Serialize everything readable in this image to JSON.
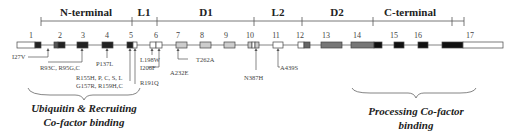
{
  "domains": [
    {
      "label": "N-terminal",
      "start": 41,
      "end": 132,
      "label_x": 86
    },
    {
      "label": "L1",
      "start": 132,
      "end": 157,
      "label_x": 144
    },
    {
      "label": "D1",
      "start": 157,
      "end": 254,
      "label_x": 206
    },
    {
      "label": "L2",
      "start": 254,
      "end": 302,
      "label_x": 278
    },
    {
      "label": "D2",
      "start": 302,
      "end": 373,
      "label_x": 337
    },
    {
      "label": "C-terminal",
      "start": 373,
      "end": 452,
      "label_x": 410
    },
    {
      "label": "",
      "start": 452,
      "end": 464,
      "label_x": 458
    }
  ],
  "exons": [
    {
      "num": "1",
      "x": 17,
      "w": 24,
      "segments": [
        {
          "w": 18,
          "fill": "#ffffff"
        },
        {
          "w": 6,
          "fill": "#222222"
        }
      ],
      "num_x": 31
    },
    {
      "num": "2",
      "x": 54,
      "w": 11,
      "segments": [
        {
          "w": 4,
          "fill": "#555555"
        },
        {
          "w": 7,
          "fill": "#222222"
        }
      ],
      "num_x": 60
    },
    {
      "num": "3",
      "x": 77,
      "w": 11,
      "segments": [
        {
          "w": 11,
          "fill": "#222222"
        }
      ],
      "num_x": 83
    },
    {
      "num": "4",
      "x": 102,
      "w": 11,
      "segments": [
        {
          "w": 11,
          "fill": "#222222"
        }
      ],
      "num_x": 107
    },
    {
      "num": "5",
      "x": 127,
      "w": 10,
      "segments": [
        {
          "w": 6,
          "fill": "#222222"
        },
        {
          "w": 4,
          "fill": "#ffffff"
        }
      ],
      "num_x": 131
    },
    {
      "num": "6",
      "x": 150,
      "w": 12,
      "segments": [
        {
          "w": 6,
          "fill": "#ffffff"
        },
        {
          "w": 6,
          "fill": "#ffffff"
        }
      ],
      "num_x": 156
    },
    {
      "num": "7",
      "x": 176,
      "w": 11,
      "segments": [
        {
          "w": 11,
          "fill": "#cccccc"
        }
      ],
      "num_x": 178
    },
    {
      "num": "8",
      "x": 200,
      "w": 11,
      "segments": [
        {
          "w": 11,
          "fill": "#cccccc"
        }
      ],
      "num_x": 202
    },
    {
      "num": "9",
      "x": 224,
      "w": 11,
      "segments": [
        {
          "w": 11,
          "fill": "#cccccc"
        }
      ],
      "num_x": 226
    },
    {
      "num": "10",
      "x": 248,
      "w": 11,
      "segments": [
        {
          "w": 4,
          "fill": "#cccccc"
        },
        {
          "w": 3,
          "fill": "#ffffff"
        },
        {
          "w": 4,
          "fill": "#cccccc"
        }
      ],
      "num_x": 250
    },
    {
      "num": "11",
      "x": 273,
      "w": 10,
      "segments": [
        {
          "w": 10,
          "fill": "#ffffff"
        }
      ],
      "num_x": 276
    },
    {
      "num": "12",
      "x": 298,
      "w": 12,
      "segments": [
        {
          "w": 6,
          "fill": "#ffffff"
        },
        {
          "w": 6,
          "fill": "#666666"
        }
      ],
      "num_x": 300
    },
    {
      "num": "13",
      "x": 321,
      "w": 21,
      "segments": [
        {
          "w": 21,
          "fill": "#777777"
        }
      ],
      "num_x": 326
    },
    {
      "num": "14",
      "x": 351,
      "w": 31,
      "segments": [
        {
          "w": 23,
          "fill": "#777777"
        },
        {
          "w": 8,
          "fill": "#111111"
        }
      ],
      "num_x": 357
    },
    {
      "num": "15",
      "x": 394,
      "w": 10,
      "segments": [
        {
          "w": 10,
          "fill": "#111111"
        }
      ],
      "num_x": 394
    },
    {
      "num": "16",
      "x": 418,
      "w": 10,
      "segments": [
        {
          "w": 10,
          "fill": "#111111"
        }
      ],
      "num_x": 418
    },
    {
      "num": "17",
      "x": 442,
      "w": 61,
      "segments": [
        {
          "w": 21,
          "fill": "#111111"
        },
        {
          "w": 40,
          "fill": "#ffffff"
        }
      ],
      "num_x": 470
    }
  ],
  "backbone": {
    "x1": 17,
    "x2": 503,
    "y": 45
  },
  "mutations": [
    {
      "label": "I27V"
    },
    {
      "label": "R93C, R95G,C"
    },
    {
      "label": "P137L"
    },
    {
      "label": "R155H, P, C, S, L"
    },
    {
      "label": "G157R, R159H,C"
    },
    {
      "label": "R191Q"
    },
    {
      "label": "L198W"
    },
    {
      "label": "I206F"
    },
    {
      "label": "A232E"
    },
    {
      "label": "T262A"
    },
    {
      "label": "N387H"
    },
    {
      "label": "A439S"
    }
  ],
  "functional_regions": [
    {
      "line1": "Ubiquitin & Recruiting",
      "line2": "Co-factor binding"
    },
    {
      "line1": "Processing Co-factor",
      "line2": "binding"
    }
  ]
}
